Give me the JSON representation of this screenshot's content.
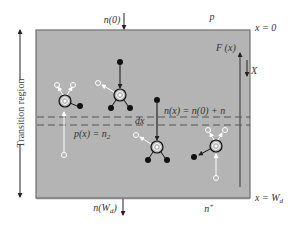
{
  "diagram": {
    "region_label": "Transition region",
    "labels": {
      "top_carrier": "n(0)",
      "top_side": "p",
      "top_boundary": "x = 0",
      "field": "F (x)",
      "axis": "X",
      "n_eq": "n(x) = n(0) + n",
      "dx": "dx",
      "p_eq": "p(x) = n",
      "p_eq_sub": "2",
      "bottom_carrier": "n(W",
      "bottom_carrier_sub": "d",
      "bottom_carrier_close": ")",
      "bottom_side": "n",
      "bottom_side_sup": "+",
      "bottom_boundary": "x = W",
      "bottom_boundary_sub": "d"
    },
    "colors": {
      "region_fill": "#b4b4b4",
      "border": "#707070",
      "electron": "#111111",
      "hole": "#ffffff",
      "dashes": "#555555"
    }
  }
}
